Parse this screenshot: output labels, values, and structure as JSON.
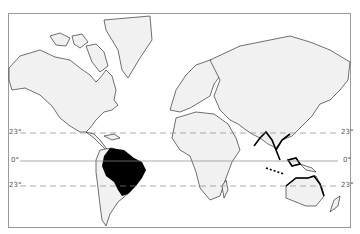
{
  "map": {
    "type": "world outline map (Mercator)",
    "latitude_lines": [
      {
        "label": "23°",
        "y": 133,
        "style": "dashed",
        "meaning": "Tropic of Cancer"
      },
      {
        "label": "0°",
        "y": 161,
        "style": "solid",
        "meaning": "Equator"
      },
      {
        "label": "23°",
        "y": 186,
        "style": "dashed",
        "meaning": "Tropic of Capricorn"
      }
    ],
    "highlighted_region": {
      "name": "Brazil / Amazon basin",
      "fill": "#000000"
    },
    "bold_coastlines": [
      "Southeast Asia",
      "Indonesia",
      "Northern Australia"
    ],
    "land_fill": "#f1f1f1",
    "outline_color": "#333333"
  },
  "labels": {
    "left_tropic_n": "23°",
    "left_equator": "0°",
    "left_tropic_s": "23°",
    "right_tropic_n": "23°",
    "right_equator": "0°",
    "right_tropic_s": "23°"
  }
}
